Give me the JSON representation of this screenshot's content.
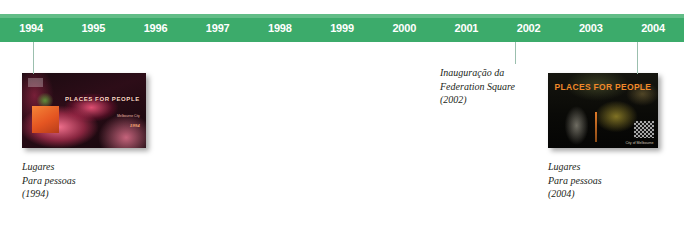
{
  "timeline": {
    "years": [
      "1994",
      "1995",
      "1996",
      "1997",
      "1998",
      "1999",
      "2000",
      "2001",
      "2002",
      "2003",
      "2004"
    ],
    "bar_color": "#3cab6b",
    "bar_highlight_color": "#62bd87",
    "label_color": "#ffffff",
    "connector_color": "#9bbfae"
  },
  "events": [
    {
      "id": "lugares-1994",
      "year": "1994",
      "caption_line1": "Lugares",
      "caption_line2": "Para pessoas",
      "caption_line3": "(1994)",
      "image": {
        "alt": "book-cover-places-for-people-1994",
        "title_line1": "PLACES FOR",
        "title_line2": "PEOPLE",
        "subtitle": "Melbourne City",
        "badge": "1994"
      }
    },
    {
      "id": "federation-square-2002",
      "year": "2002",
      "caption_line1": "Inauguração da",
      "caption_line2": "Federation Square",
      "caption_line3": "(2002)"
    },
    {
      "id": "lugares-2004",
      "year": "2004",
      "caption_line1": "Lugares",
      "caption_line2": "Para pessoas",
      "caption_line3": "(2004)",
      "image": {
        "alt": "book-cover-places-for-people-2004",
        "title_line1": "PLACES",
        "title_line2": "FOR PEOPLE",
        "logo": "City of Melbourne"
      }
    }
  ]
}
